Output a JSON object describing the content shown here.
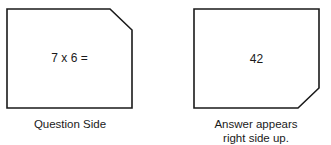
{
  "question_card": {
    "text": "7 x 6 =",
    "caption": "Question Side",
    "cut_corner": "top-right"
  },
  "answer_card": {
    "text": "42",
    "caption_line1": "Answer appears",
    "caption_line2": "right side up.",
    "cut_corner": "bottom-right"
  },
  "colors": {
    "stroke": "#1a1a1a",
    "background": "#ffffff"
  }
}
